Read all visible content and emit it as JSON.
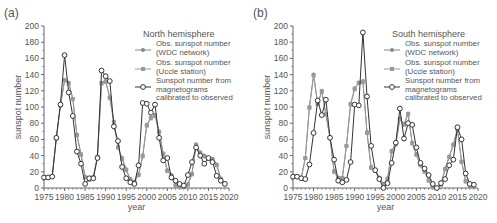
{
  "chart_data": [
    {
      "panel_label": "(a)",
      "type": "line",
      "title": "North hemisphere",
      "xlabel": "year",
      "ylabel": "sunspot number",
      "xlim": [
        1975,
        2020
      ],
      "ylim": [
        0,
        200
      ],
      "xticks": [
        1975,
        1980,
        1985,
        1990,
        1995,
        2000,
        2005,
        2010,
        2015,
        2020
      ],
      "yticks": [
        0,
        20,
        40,
        60,
        80,
        100,
        120,
        140,
        160,
        180,
        200
      ],
      "grid": false,
      "legend_position": "upper right",
      "series": [
        {
          "name": "Obs. sunspot number (WDC network)",
          "marker": "filled-circle",
          "color": "#888888",
          "x": [
            1975,
            1976,
            1977,
            1978,
            1979,
            1980,
            1981,
            1982,
            1983,
            1984,
            1985,
            1986,
            1987,
            1988,
            1989,
            1990,
            1991,
            1992,
            1993,
            1994,
            1995,
            1996,
            1997,
            1998,
            1999,
            2000,
            2001,
            2002,
            2003,
            2004,
            2005,
            2006,
            2007,
            2008,
            2009,
            2010,
            2011,
            2012,
            2013,
            2014,
            2015,
            2016,
            2017,
            2018,
            2019
          ],
          "y": [
            13,
            13,
            14,
            61,
            102,
            133,
            130,
            110,
            66,
            42,
            14,
            11,
            14,
            39,
            130,
            132,
            112,
            82,
            51,
            37,
            23,
            11,
            8,
            17,
            40,
            78,
            87,
            90,
            70,
            43,
            22,
            16,
            4,
            2,
            2,
            5,
            18,
            54,
            44,
            40,
            37,
            36,
            29,
            12,
            6
          ]
        },
        {
          "name": "Obs. sunspot number (Uccle station)",
          "marker": "filled-square",
          "color": "#999999",
          "x": [
            1975,
            1976,
            1977,
            1978,
            1979,
            1980,
            1981,
            1982,
            1983,
            1984,
            1985,
            1986,
            1987,
            1988,
            1989,
            1990,
            1991,
            1992,
            1993,
            1994,
            1995,
            1996,
            1997,
            1998,
            1999,
            2000,
            2001,
            2002,
            2003,
            2004,
            2005,
            2006,
            2007,
            2008,
            2009,
            2010,
            2011,
            2012,
            2013,
            2014,
            2015,
            2016,
            2017,
            2018,
            2019
          ],
          "y": [
            13,
            13,
            14,
            61,
            102,
            133,
            129,
            110,
            65,
            41,
            13,
            10,
            13,
            38,
            129,
            131,
            111,
            81,
            50,
            36,
            22,
            10,
            7,
            16,
            39,
            77,
            86,
            89,
            69,
            42,
            21,
            15,
            3,
            1,
            1,
            4,
            17,
            53,
            43,
            39,
            36,
            35,
            28,
            11,
            5
          ]
        },
        {
          "name": "Sunspot number from magnetograms calibrated to observed",
          "marker": "open-circle",
          "color": "#333333",
          "x": [
            1975,
            1976,
            1977,
            1978,
            1979,
            1980,
            1981,
            1982,
            1983,
            1984,
            1985,
            1986,
            1987,
            1988,
            1989,
            1990,
            1991,
            1992,
            1993,
            1994,
            1995,
            1996,
            1997,
            1998,
            1999,
            2000,
            2001,
            2002,
            2003,
            2004,
            2005,
            2006,
            2007,
            2008,
            2009,
            2010,
            2011,
            2012,
            2013,
            2014,
            2015,
            2016,
            2017,
            2018,
            2019
          ],
          "y": [
            13,
            13,
            14,
            62,
            103,
            164,
            118,
            89,
            45,
            30,
            5,
            12,
            12,
            37,
            145,
            138,
            132,
            76,
            58,
            26,
            12,
            7,
            5,
            28,
            105,
            104,
            93,
            103,
            62,
            34,
            37,
            13,
            9,
            5,
            3,
            16,
            32,
            50,
            40,
            30,
            37,
            32,
            15,
            9,
            5
          ]
        }
      ]
    },
    {
      "panel_label": "(b)",
      "type": "line",
      "title": "South hemisphere",
      "xlabel": "year",
      "ylabel": "sunspot number",
      "xlim": [
        1975,
        2020
      ],
      "ylim": [
        0,
        200
      ],
      "xticks": [
        1975,
        1980,
        1985,
        1990,
        1995,
        2000,
        2005,
        2010,
        2015,
        2020
      ],
      "yticks": [
        0,
        20,
        40,
        60,
        80,
        100,
        120,
        140,
        160,
        180,
        200
      ],
      "grid": false,
      "legend_position": "upper right",
      "series": [
        {
          "name": "Obs. sunspot number (WDC network)",
          "marker": "filled-circle",
          "color": "#888888",
          "x": [
            1975,
            1976,
            1977,
            1978,
            1979,
            1980,
            1981,
            1982,
            1983,
            1984,
            1985,
            1986,
            1987,
            1988,
            1989,
            1990,
            1991,
            1992,
            1993,
            1994,
            1995,
            1996,
            1997,
            1998,
            1999,
            2000,
            2001,
            2002,
            2003,
            2004,
            2005,
            2006,
            2007,
            2008,
            2009,
            2010,
            2011,
            2012,
            2013,
            2014,
            2015,
            2016,
            2017,
            2018,
            2019
          ],
          "y": [
            14,
            14,
            12,
            37,
            100,
            140,
            104,
            120,
            91,
            62,
            21,
            13,
            13,
            52,
            104,
            123,
            130,
            132,
            69,
            26,
            22,
            13,
            5,
            12,
            46,
            55,
            86,
            79,
            92,
            56,
            42,
            29,
            21,
            10,
            2,
            0,
            5,
            24,
            39,
            54,
            73,
            33,
            9,
            3,
            3
          ]
        },
        {
          "name": "Obs. sunspot number (Uccle station)",
          "marker": "filled-square",
          "color": "#999999",
          "x": [
            1975,
            1976,
            1977,
            1978,
            1979,
            1980,
            1981,
            1982,
            1983,
            1984,
            1985,
            1986,
            1987,
            1988,
            1989,
            1990,
            1991,
            1992,
            1993,
            1994,
            1995,
            1996,
            1997,
            1998,
            1999,
            2000,
            2001,
            2002,
            2003,
            2004,
            2005,
            2006,
            2007,
            2008,
            2009,
            2010,
            2011,
            2012,
            2013,
            2014,
            2015,
            2016,
            2017,
            2018,
            2019
          ],
          "y": [
            14,
            14,
            12,
            37,
            99,
            139,
            104,
            119,
            91,
            62,
            20,
            12,
            12,
            52,
            103,
            122,
            130,
            131,
            68,
            25,
            21,
            12,
            4,
            11,
            45,
            54,
            85,
            78,
            91,
            55,
            41,
            28,
            20,
            9,
            1,
            0,
            4,
            23,
            38,
            53,
            72,
            32,
            8,
            2,
            2
          ]
        },
        {
          "name": "Sunspot number from magnetograms calibrated to observed",
          "marker": "open-circle",
          "color": "#333333",
          "x": [
            1975,
            1976,
            1977,
            1978,
            1979,
            1980,
            1981,
            1982,
            1983,
            1984,
            1985,
            1986,
            1987,
            1988,
            1989,
            1990,
            1991,
            1992,
            1993,
            1994,
            1995,
            1996,
            1997,
            1998,
            1999,
            2000,
            2001,
            2002,
            2003,
            2004,
            2005,
            2006,
            2007,
            2008,
            2009,
            2010,
            2011,
            2012,
            2013,
            2014,
            2015,
            2016,
            2017,
            2018,
            2019
          ],
          "y": [
            14,
            14,
            12,
            11,
            29,
            68,
            108,
            90,
            109,
            62,
            35,
            9,
            7,
            10,
            32,
            103,
            102,
            192,
            113,
            52,
            22,
            11,
            0,
            6,
            31,
            56,
            98,
            61,
            80,
            78,
            50,
            31,
            24,
            16,
            5,
            0,
            6,
            11,
            28,
            35,
            75,
            60,
            18,
            5,
            4
          ]
        }
      ]
    }
  ]
}
